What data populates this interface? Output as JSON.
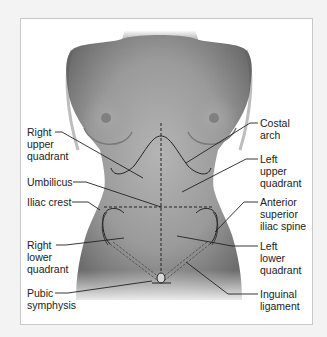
{
  "diagram": {
    "labels": {
      "right_upper_quadrant": "Right\nupper\nquadrant",
      "umbilicus": "Umbilicus",
      "iliac_crest": "Iliac crest",
      "right_lower_quadrant": "Right\nlower\nquadrant",
      "pubic_symphysis": "Pubic\nsymphysis",
      "costal_arch": "Costal\narch",
      "left_upper_quadrant": "Left\nupper\nquadrant",
      "anterior_superior_iliac_spine": "Anterior\nsuperior\niliac spine",
      "left_lower_quadrant": "Left\nlower\nquadrant",
      "inguinal_ligament": "Inguinal\nligament"
    },
    "colors": {
      "background": "#f3f3f3",
      "frame": "#ffffff",
      "frame_border": "#c8c8c8",
      "skin_dark": "#6e6e6e",
      "skin_light": "#b8b8b8",
      "line": "#222222"
    }
  }
}
